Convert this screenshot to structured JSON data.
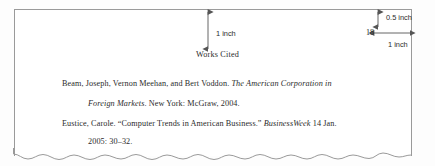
{
  "figure": {
    "kind": "mla-works-cited-page-with-margin-annotations",
    "page_number": "18",
    "heading": "Works Cited"
  },
  "annotations": {
    "top_margin": {
      "label": "1 inch",
      "icon": "double-headed-vertical-arrow"
    },
    "header_offset": {
      "label": "0.5 inch",
      "icon": "double-headed-vertical-arrow"
    },
    "right_margin": {
      "label": "1 inch",
      "icon": "double-headed-horizontal-arrow"
    }
  },
  "entries": [
    {
      "line": 1,
      "indent": "first",
      "segments": [
        {
          "text": "Beam, Joseph, Vernon Meehan, and Bert Voddon.  ",
          "style": "roman"
        },
        {
          "text": "The American Corporation in",
          "style": "italic"
        }
      ]
    },
    {
      "line": 2,
      "indent": "hanging",
      "segments": [
        {
          "text": "Foreign Markets",
          "style": "italic"
        },
        {
          "text": ".  New York: McGraw, 2004.",
          "style": "roman"
        }
      ]
    },
    {
      "line": 3,
      "indent": "first",
      "segments": [
        {
          "text": "Eustice, Carole.  “Computer Trends in American Business.”  ",
          "style": "roman"
        },
        {
          "text": "BusinessWeek",
          "style": "italic"
        },
        {
          "text": " 14 Jan.",
          "style": "roman"
        }
      ]
    },
    {
      "line": 4,
      "indent": "hanging",
      "segments": [
        {
          "text": "2005:  30–32.",
          "style": "roman"
        }
      ]
    }
  ],
  "colors": {
    "page_border": "#9a9a9a",
    "text": "#2b2b2b",
    "arrow": "#555555",
    "paper": "#ffffff"
  }
}
